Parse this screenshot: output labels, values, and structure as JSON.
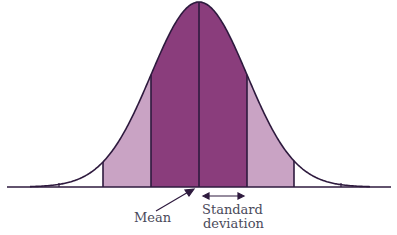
{
  "diagram": {
    "type": "normal-distribution",
    "labels": {
      "mean": "Mean",
      "sd_line1": "Standard",
      "sd_line2": "deviation"
    },
    "colors": {
      "inner_band": "#8a3d7c",
      "outer_band": "#c9a3c4",
      "outline": "#2e1a3e",
      "label_text": "#4a4a5a"
    }
  }
}
